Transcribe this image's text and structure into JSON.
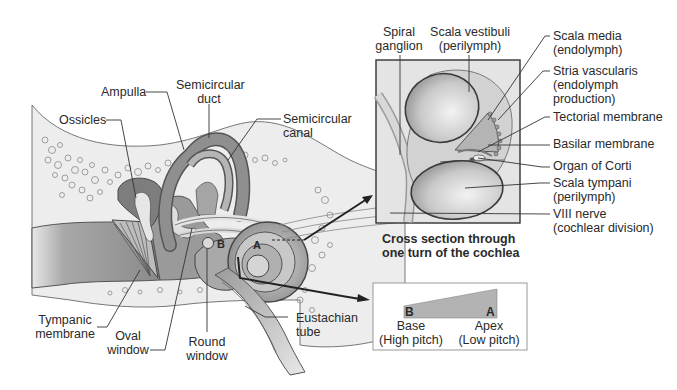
{
  "ear_labels": {
    "ampulla": "Ampulla",
    "semicircular_duct_line1": "Semicircular",
    "semicircular_duct_line2": "duct",
    "semicircular_canal_line1": "Semicircular",
    "semicircular_canal_line2": "canal",
    "ossicles": "Ossicles",
    "tympanic_membrane_line1": "Tympanic",
    "tympanic_membrane_line2": "membrane",
    "oval_window_line1": "Oval",
    "oval_window_line2": "window",
    "round_window_line1": "Round",
    "round_window_line2": "window",
    "eustachian_tube_line1": "Eustachian",
    "eustachian_tube_line2": "tube",
    "marker_a": "A",
    "marker_b": "B"
  },
  "cross_section": {
    "spiral_ganglion_line1": "Spiral",
    "spiral_ganglion_line2": "ganglion",
    "scala_vestibuli_line1": "Scala vestibuli",
    "scala_vestibuli_line2": "(perilymph)",
    "scala_media_line1": "Scala media",
    "scala_media_line2": "(endolymph)",
    "stria_vascularis_line1": "Stria vascularis",
    "stria_vascularis_line2": "(endolymph",
    "stria_vascularis_line3": "production)",
    "tectorial_membrane": "Tectorial membrane",
    "basilar_membrane": "Basilar membrane",
    "organ_of_corti": "Organ of Corti",
    "scala_tympani_line1": "Scala tympani",
    "scala_tympani_line2": "(perilymph)",
    "viii_nerve_line1": "VIII nerve",
    "viii_nerve_line2": "(cochlear division)",
    "caption_line1": "Cross section through",
    "caption_line2": "one turn of the cochlea"
  },
  "pitch_diagram": {
    "marker_b": "B",
    "marker_a": "A",
    "base_label": "Base",
    "base_pitch": "(High pitch)",
    "apex_label": "Apex",
    "apex_pitch": "(Low pitch)"
  }
}
